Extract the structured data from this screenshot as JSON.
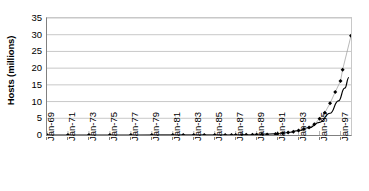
{
  "chart_data": {
    "type": "scatter",
    "title": "",
    "xlabel": "",
    "ylabel": "Hosts (millions)",
    "ylim": [
      0,
      35
    ],
    "yticks": [
      0,
      5,
      10,
      15,
      20,
      25,
      30,
      35
    ],
    "ytick_labels": [
      "0",
      "5",
      "10",
      "15",
      "20",
      "25",
      "30",
      "35"
    ],
    "xtick_labels": [
      "Jan-69",
      "Jan-71",
      "Jan-73",
      "Jan-75",
      "Jan-77",
      "Jan-79",
      "Jan-81",
      "Jan-83",
      "Jan-85",
      "Jan-87",
      "Jan-89",
      "Jan-91",
      "Jan-93",
      "Jan-95",
      "Jan-97"
    ],
    "xlim_years": [
      1969,
      1998
    ],
    "grid": "horizontal",
    "legend": "none",
    "marker": "diamond",
    "marker_color": "#000000",
    "trendline_color": "#000000",
    "gridline_color": "#c8c8c8",
    "series": [
      {
        "name": "Internet hosts (measured)",
        "marker": "diamond",
        "points": [
          {
            "x": 1969.0,
            "y": 0.0
          },
          {
            "x": 1971.0,
            "y": 0.0
          },
          {
            "x": 1973.0,
            "y": 0.0
          },
          {
            "x": 1975.0,
            "y": 0.0
          },
          {
            "x": 1977.0,
            "y": 0.0
          },
          {
            "x": 1979.0,
            "y": 0.0
          },
          {
            "x": 1981.0,
            "y": 0.0
          },
          {
            "x": 1982.0,
            "y": 0.0
          },
          {
            "x": 1983.0,
            "y": 0.0
          },
          {
            "x": 1984.0,
            "y": 0.0
          },
          {
            "x": 1985.0,
            "y": 0.0
          },
          {
            "x": 1986.0,
            "y": 0.01
          },
          {
            "x": 1986.6,
            "y": 0.01
          },
          {
            "x": 1987.0,
            "y": 0.03
          },
          {
            "x": 1987.6,
            "y": 0.03
          },
          {
            "x": 1988.0,
            "y": 0.06
          },
          {
            "x": 1988.6,
            "y": 0.06
          },
          {
            "x": 1989.0,
            "y": 0.08
          },
          {
            "x": 1989.5,
            "y": 0.13
          },
          {
            "x": 1990.0,
            "y": 0.16
          },
          {
            "x": 1990.8,
            "y": 0.31
          },
          {
            "x": 1991.0,
            "y": 0.38
          },
          {
            "x": 1991.5,
            "y": 0.54
          },
          {
            "x": 1992.0,
            "y": 0.73
          },
          {
            "x": 1992.5,
            "y": 0.99
          },
          {
            "x": 1993.0,
            "y": 1.31
          },
          {
            "x": 1993.5,
            "y": 1.78
          },
          {
            "x": 1994.0,
            "y": 2.22
          },
          {
            "x": 1994.5,
            "y": 3.21
          },
          {
            "x": 1995.0,
            "y": 4.85
          },
          {
            "x": 1995.5,
            "y": 6.64
          },
          {
            "x": 1996.0,
            "y": 9.47
          },
          {
            "x": 1996.5,
            "y": 12.88
          },
          {
            "x": 1997.0,
            "y": 16.15
          },
          {
            "x": 1997.2,
            "y": 19.54
          },
          {
            "x": 1998.0,
            "y": 29.67
          }
        ]
      },
      {
        "name": "Fitted exponential trend",
        "marker": "none",
        "points": [
          {
            "x": 1969.0,
            "y": 0.0
          },
          {
            "x": 1975.0,
            "y": 0.0
          },
          {
            "x": 1980.0,
            "y": 0.01
          },
          {
            "x": 1984.0,
            "y": 0.02
          },
          {
            "x": 1986.0,
            "y": 0.05
          },
          {
            "x": 1988.0,
            "y": 0.1
          },
          {
            "x": 1989.0,
            "y": 0.16
          },
          {
            "x": 1990.0,
            "y": 0.26
          },
          {
            "x": 1991.0,
            "y": 0.44
          },
          {
            "x": 1992.0,
            "y": 0.75
          },
          {
            "x": 1993.0,
            "y": 1.3
          },
          {
            "x": 1994.0,
            "y": 2.2
          },
          {
            "x": 1995.0,
            "y": 3.8
          },
          {
            "x": 1996.0,
            "y": 6.5
          },
          {
            "x": 1996.8,
            "y": 10.2
          },
          {
            "x": 1997.4,
            "y": 14.0
          },
          {
            "x": 1997.8,
            "y": 17.2
          }
        ]
      }
    ]
  }
}
